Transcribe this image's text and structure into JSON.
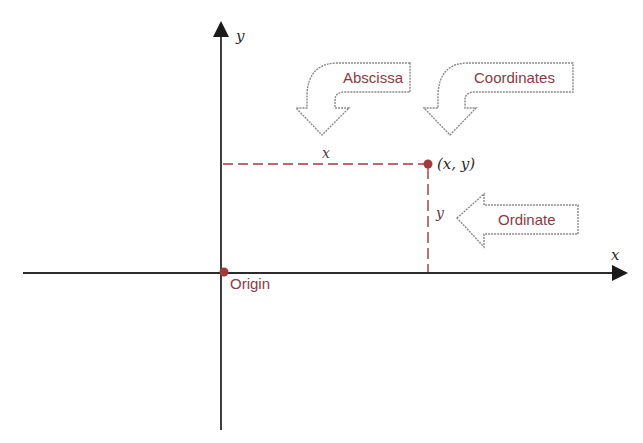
{
  "diagram": {
    "colors": {
      "axis": "#2b2b2b",
      "accent": "#a13a3f",
      "label_text": "#8e3a44",
      "callout_outline": "#8a8a8a",
      "background": "#ffffff"
    },
    "axes": {
      "x_label": "x",
      "y_label": "y",
      "origin": {
        "x": 222,
        "y": 272
      },
      "x_axis": {
        "x1": 23,
        "x2": 627
      },
      "y_axis": {
        "y1": 22,
        "y2": 430
      }
    },
    "point": {
      "label": "(x, y)",
      "x": 428,
      "y": 164
    },
    "projections": {
      "horizontal_label": "x",
      "vertical_label": "y"
    },
    "origin_label": "Origin",
    "callouts": [
      {
        "id": "abscissa",
        "label": "Abscissa",
        "direction": "down-left"
      },
      {
        "id": "coordinates",
        "label": "Coordinates",
        "direction": "down-left"
      },
      {
        "id": "ordinate",
        "label": "Ordinate",
        "direction": "left"
      }
    ]
  }
}
